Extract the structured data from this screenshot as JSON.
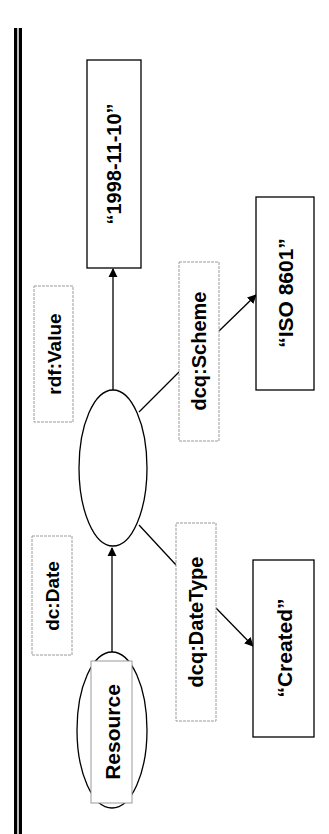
{
  "diagram": {
    "type": "rdf-graph",
    "orientation": "rotated-90-ccw",
    "nodes": {
      "resource": {
        "label": "Resource",
        "shape": "ellipse"
      },
      "blank": {
        "label": "",
        "shape": "ellipse"
      },
      "date_value": {
        "label": "“1998-11-10”",
        "shape": "rect"
      },
      "scheme_value": {
        "label": "“ISO 8601”",
        "shape": "rect"
      },
      "datetype_value": {
        "label": "“Created”",
        "shape": "rect"
      }
    },
    "edges": {
      "dc_date": {
        "label": "dc:Date",
        "from": "Resource",
        "to": "blank"
      },
      "rdf_value": {
        "label": "rdf:Value",
        "from": "blank",
        "to": "“1998-11-10”"
      },
      "dcq_scheme": {
        "label": "dcq:Scheme",
        "from": "blank",
        "to": "“ISO 8601”"
      },
      "dcq_datetype": {
        "label": "dcq:DateType",
        "from": "blank",
        "to": "“Created”"
      }
    },
    "colors": {
      "stroke": "#000000",
      "label_box_border": "#9a9a9a",
      "background": "#ffffff"
    }
  }
}
